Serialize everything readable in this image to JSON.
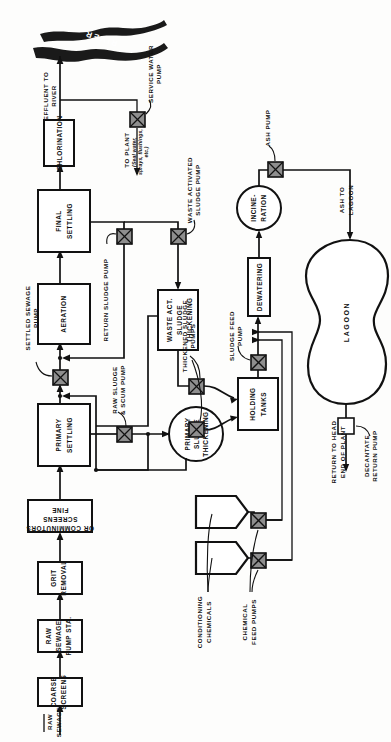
{
  "diagram": {
    "orientation": "rotated-90",
    "colors": {
      "line": "#111111",
      "pump_fill": "#8e8e8e",
      "background": "#ffffff",
      "river": "#1a1a1a"
    },
    "inlet": {
      "line1": "RAW",
      "line2": "SEWAGE"
    },
    "units": [
      {
        "id": "coarse-screens",
        "line1": "COARSE",
        "line2": "SCREENS",
        "line3": ""
      },
      {
        "id": "raw-sewage-pump-sta",
        "line1": "RAW",
        "line2": "SEWAGE",
        "line3": "PUMP STA."
      },
      {
        "id": "grit-removal",
        "line1": "GRIT",
        "line2": "REMOVAL",
        "line3": ""
      },
      {
        "id": "fine-screens",
        "line1": "FINE",
        "line2": "SCREENS",
        "line3": "OR COMMINUTORS"
      },
      {
        "id": "primary-settling",
        "line1": "PRIMARY",
        "line2": "SETTLING",
        "line3": ""
      },
      {
        "id": "aeration",
        "line1": "AERATION",
        "line2": "",
        "line3": ""
      },
      {
        "id": "final-settling",
        "line1": "FINAL",
        "line2": "SETTLING",
        "line3": ""
      },
      {
        "id": "chlorination",
        "line1": "CHLORINATION",
        "line2": "",
        "line3": ""
      },
      {
        "id": "waste-act-sludge-thickening",
        "line1": "WASTE  ACT.",
        "line2": "SLUDGE",
        "line3": "THICKENING"
      },
      {
        "id": "primary-sludge-thickening",
        "line1": "PRIMARY",
        "line2": "SLUDGE",
        "line3": "THICKENING"
      },
      {
        "id": "holding-tanks",
        "line1": "HOLDING",
        "line2": "TANKS",
        "line3": ""
      },
      {
        "id": "dewatering",
        "line1": "DEWATERING",
        "line2": "",
        "line3": ""
      },
      {
        "id": "incineration",
        "line1": "INCINE-",
        "line2": "RATION",
        "line3": ""
      },
      {
        "id": "lagoon",
        "line1": "LAGOON",
        "line2": "",
        "line3": ""
      }
    ],
    "pumps": [
      {
        "id": "settled-sewage-pump",
        "line1": "SETTLED SEWAGE",
        "line2": "PUMP"
      },
      {
        "id": "raw-sludge-scum-pump",
        "line1": "RAW SLUDGE",
        "line2": "& SCUM PUMP"
      },
      {
        "id": "return-sludge-pump",
        "line1": "RETURN SLUDGE PUMP",
        "line2": ""
      },
      {
        "id": "waste-activated-sludge-pump",
        "line1": "WASTE  ACTIVATED",
        "line2": "SLUDGE  PUMP"
      },
      {
        "id": "service-water-pump",
        "line1": "SERVICE WATER",
        "line2": "PUMP"
      },
      {
        "id": "thickened-sludge-pumps",
        "line1": "THICKENED SLUDGE",
        "line2": "PUMPS"
      },
      {
        "id": "sludge-feed-pump",
        "line1": "SLUDGE FEED",
        "line2": "PUMP"
      },
      {
        "id": "chemical-feed-pumps",
        "line1": "CHEMICAL",
        "line2": "FEED PUMPS"
      },
      {
        "id": "ash-pump",
        "line1": "ASH PUMP",
        "line2": ""
      },
      {
        "id": "decantate-return-pump",
        "line1": "DECANTATE",
        "line2": "RETURN PUMP"
      }
    ],
    "streams": [
      {
        "id": "effluent-to-river",
        "line1": "EFFLUENT TO",
        "line2": "RIVER"
      },
      {
        "id": "to-plant",
        "line1": "TO PLANT",
        "line2": "(Seal water,",
        "line3": "sprays, flushings,",
        "line4": "etc.)"
      },
      {
        "id": "ash-to-lagoon",
        "line1": "ASH TO",
        "line2": "LAGOON"
      },
      {
        "id": "return-to-head-end",
        "line1": "RETURN TO HEAD",
        "line2": "END OF PLANT"
      },
      {
        "id": "conditioning-chemicals",
        "line1": "CONDITIONING",
        "line2": "CHEMICALS"
      }
    ],
    "river_label": "RIVER"
  }
}
